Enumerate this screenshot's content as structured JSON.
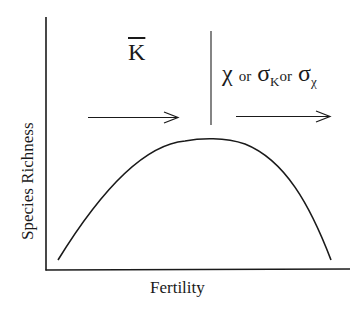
{
  "diagram": {
    "type": "hump-shaped curve",
    "x_axis_label": "Fertility",
    "y_axis_label": "Species Richness",
    "left_region": {
      "symbol": "K",
      "symbol_decoration": "overbar",
      "arrow_direction": "right"
    },
    "right_region": {
      "parts": [
        {
          "symbol": "χ",
          "decoration": "overbar"
        },
        {
          "text": "or"
        },
        {
          "symbol": "σ",
          "subscript": "K"
        },
        {
          "text": "or"
        },
        {
          "symbol": "σ",
          "subscript": "χ"
        }
      ],
      "arrow_direction": "right"
    },
    "divider": "vertical line at curve peak",
    "colors": {
      "ink": "#1a1a1a",
      "background": "#ffffff"
    }
  },
  "labels": {
    "xlabel": "Fertility",
    "ylabel": "Species Richness",
    "k": "K",
    "chi": "χ",
    "or1": "or",
    "sigma1": "σ",
    "sub1": "K",
    "or2": "or",
    "sigma2": "σ",
    "sub2": "χ"
  }
}
